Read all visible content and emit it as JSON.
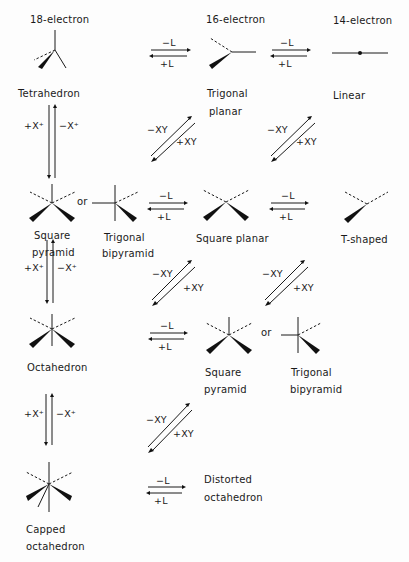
{
  "columns": {
    "col1_header": "18-electron",
    "col2_header": "16-electron",
    "col3_header": "14-electron"
  },
  "geometries": {
    "tetrahedron": "Tetrahedron",
    "trigonal_planar_1": "Trigonal",
    "trigonal_planar_2": "planar",
    "linear": "Linear",
    "square_pyramid_1_a": "Square",
    "square_pyramid_1_b": "pyramid",
    "tbp_1_a": "Trigonal",
    "tbp_1_b": "bipyramid",
    "or_1": "or",
    "square_planar": "Square planar",
    "t_shaped": "T-shaped",
    "octahedron": "Octahedron",
    "square_pyramid_2_a": "Square",
    "square_pyramid_2_b": "pyramid",
    "or_2": "or",
    "tbp_2_a": "Trigonal",
    "tbp_2_b": "bipyramid",
    "capped_octahedron_a": "Capped",
    "capped_octahedron_b": "octahedron",
    "distorted_octahedron_a": "Distorted",
    "distorted_octahedron_b": "octahedron"
  },
  "arrows": {
    "minus_L": "−L",
    "plus_L": "+L",
    "minus_XY": "−XY",
    "plus_XY": "+XY",
    "plus_X": "+X⁺",
    "minus_X": "−X⁺"
  }
}
